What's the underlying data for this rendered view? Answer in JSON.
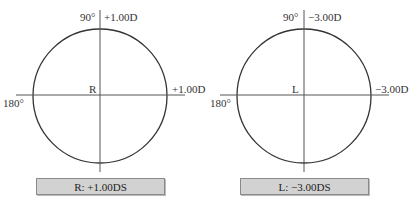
{
  "panels": [
    {
      "eye": "R",
      "label_90": "90°",
      "label_180": "180°",
      "power_vertical": "+1.00D",
      "power_horizontal": "+1.00D",
      "summary": "R: +1.00DS"
    },
    {
      "eye": "L",
      "label_90": "90°",
      "label_180": "180°",
      "power_vertical": "−3.00D",
      "power_horizontal": "−3.00D",
      "summary": "L: −3.00DS"
    }
  ],
  "colors": {
    "line": "#333333",
    "box_fill": "#d2d2d2",
    "box_border": "#8a8a8a"
  }
}
